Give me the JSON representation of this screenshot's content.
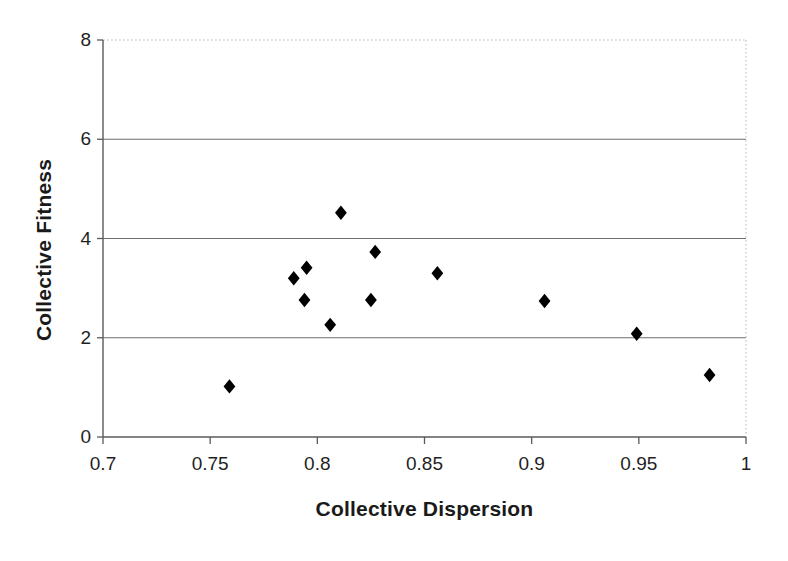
{
  "chart_data": {
    "type": "scatter",
    "title": "",
    "xlabel": "Collective Dispersion",
    "ylabel": "Collective Fitness",
    "xlim": [
      0.7,
      1.0
    ],
    "ylim": [
      0,
      8
    ],
    "xticks": [
      "0.7",
      "0.75",
      "0.8",
      "0.85",
      "0.9",
      "0.95",
      "1"
    ],
    "xtick_values": [
      0.7,
      0.75,
      0.8,
      0.85,
      0.9,
      0.95,
      1.0
    ],
    "yticks": [
      "0",
      "2",
      "4",
      "6",
      "8"
    ],
    "ytick_values": [
      0,
      2,
      4,
      6,
      8
    ],
    "grid": "horizontal",
    "legend": "none",
    "marker": "filled-diamond",
    "marker_color": "#000000",
    "series": [
      {
        "name": "Collective Fitness vs Collective Dispersion",
        "points": [
          {
            "x": 0.759,
            "y": 1.02
          },
          {
            "x": 0.789,
            "y": 3.2
          },
          {
            "x": 0.794,
            "y": 2.76
          },
          {
            "x": 0.795,
            "y": 3.41
          },
          {
            "x": 0.806,
            "y": 2.26
          },
          {
            "x": 0.811,
            "y": 4.52
          },
          {
            "x": 0.825,
            "y": 2.76
          },
          {
            "x": 0.827,
            "y": 3.73
          },
          {
            "x": 0.856,
            "y": 3.3
          },
          {
            "x": 0.906,
            "y": 2.74
          },
          {
            "x": 0.949,
            "y": 2.08
          },
          {
            "x": 0.983,
            "y": 1.25
          }
        ]
      }
    ]
  },
  "colors": {
    "axis": "#5a5a5a",
    "gridline": "#6e6e6e",
    "border_dotted": "#b9b9b9",
    "marker": "#000000",
    "text": "#1a1a1a"
  }
}
